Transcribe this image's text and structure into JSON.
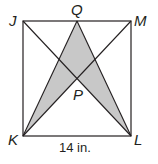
{
  "diagram": {
    "type": "geometry-square",
    "points": {
      "J": {
        "label": "J",
        "x": 23,
        "y": 21
      },
      "M": {
        "label": "M",
        "x": 131,
        "y": 21
      },
      "K": {
        "label": "K",
        "x": 23,
        "y": 136
      },
      "L": {
        "label": "L",
        "x": 131,
        "y": 136
      },
      "Q": {
        "label": "Q",
        "x": 77,
        "y": 21
      },
      "P": {
        "label": "P",
        "x": 77,
        "y": 78
      }
    },
    "dimension_label": "14 in.",
    "shaded_region": "QKPL",
    "colors": {
      "stroke": "#231f20",
      "shade": "#c8c8c8"
    }
  }
}
